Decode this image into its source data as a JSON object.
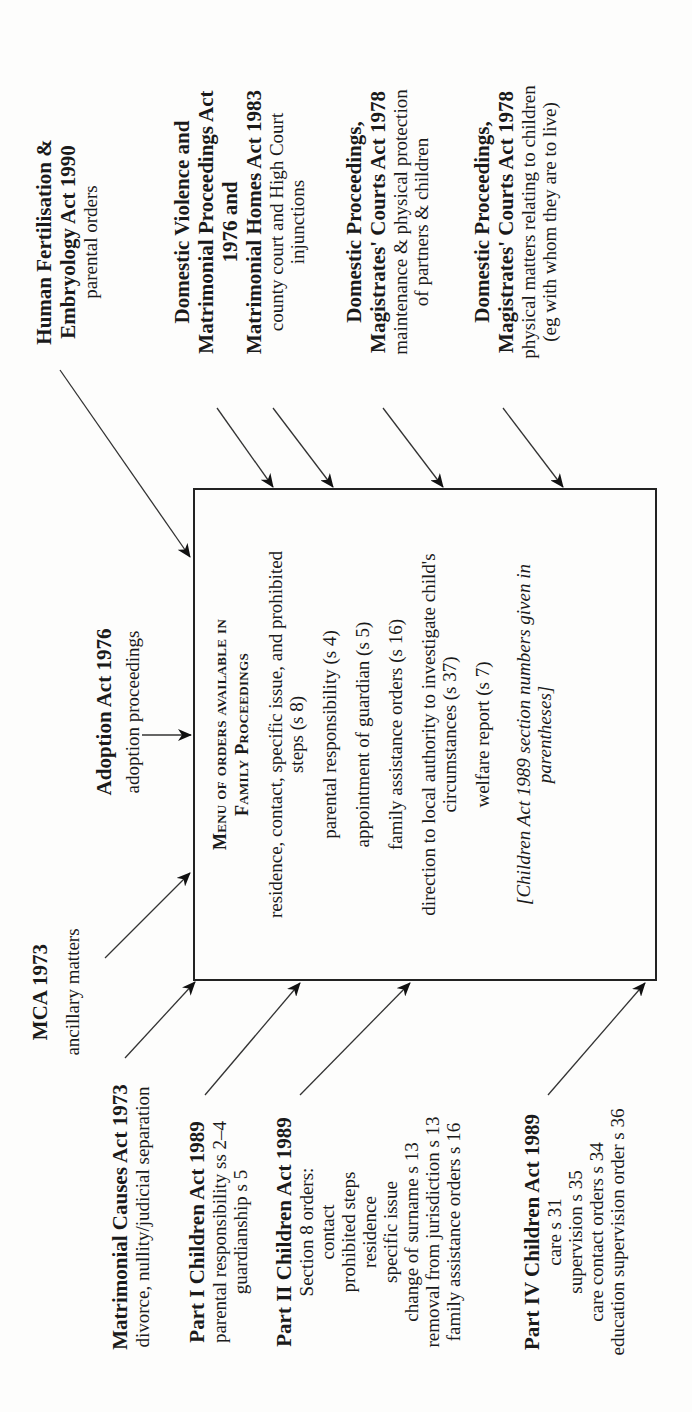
{
  "diagram": {
    "orientation": "rotated 90 degrees counter-clockwise",
    "center_box": {
      "title_line1": "Menu of orders available in",
      "title_line2": "Family Proceedings",
      "items": [
        "residence, contact, specific issue, and prohibited steps (s 8)",
        "parental responsibility (s 4)",
        "appointment of guardian (s 5)",
        "family assistance orders (s 16)",
        "direction to local authority to investigate child's circumstances (s 37)",
        "welfare report (s 7)"
      ],
      "note": "[Children Act 1989 section numbers given in parentheses]"
    },
    "sources": {
      "hfea": {
        "title": "Human Fertilisation & Embryology Act 1990",
        "detail": "parental orders"
      },
      "dvmpa": {
        "title_1": "Domestic Violence and",
        "title_2": "Matrimonial Proceedings Act",
        "title_3": "1976 and",
        "title_4": "Matrimonial Homes Act 1983",
        "detail_1": "county court and High Court",
        "detail_2": "injunctions"
      },
      "dpmca_1": {
        "title_1": "Domestic Proceedings,",
        "title_2": "Magistrates' Courts Act 1978",
        "detail_1": "maintenance & physical protection",
        "detail_2": "of partners & children"
      },
      "dpmca_2": {
        "title_1": "Domestic Proceedings,",
        "title_2": "Magistrates' Courts Act 1978",
        "detail_1": "physical matters relating to children",
        "detail_2": "(eg with whom they are to live)"
      },
      "adoption": {
        "title": "Adoption Act 1976",
        "detail": "adoption proceedings"
      },
      "mca_ancillary": {
        "title": "MCA 1973",
        "detail": "ancillary matters"
      },
      "mca": {
        "title": "Matrimonial Causes Act 1973",
        "detail": "divorce, nullity/judicial separation"
      },
      "part1": {
        "title": "Part I Children Act 1989",
        "detail_1": "parental responsibility ss 2–4",
        "detail_2": "guardianship s 5"
      },
      "part2": {
        "title": "Part II Children Act 1989",
        "lines": [
          "Section 8 orders:",
          "contact",
          "prohibited steps",
          "residence",
          "specific issue",
          "change of surname s 13",
          "removal from jurisdiction s 13",
          "family assistance orders s 16"
        ]
      },
      "part4": {
        "title": "Part IV Children Act 1989",
        "lines": [
          "care s 31",
          "supervision s 35",
          "care contact orders s 34",
          "education supervision order s 36"
        ]
      }
    }
  }
}
